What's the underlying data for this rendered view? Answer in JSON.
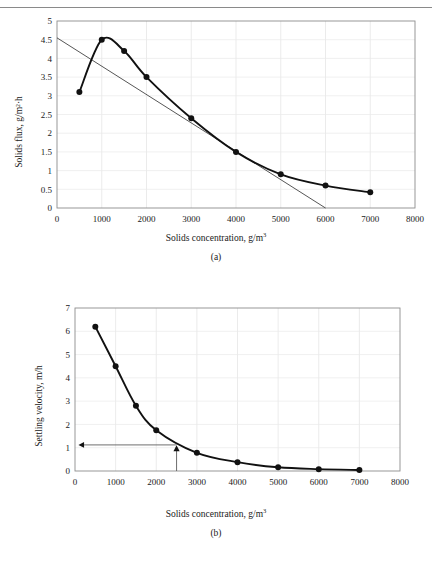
{
  "page": {
    "header_text": "",
    "background_color": "#ffffff"
  },
  "figure_a": {
    "caption": "(a)",
    "xlabel_main": "Solids concentration, g/m",
    "xlabel_sup": "3",
    "ylabel": "Solids flux, g/m²·h"
  },
  "figure_b": {
    "caption": "(b)",
    "xlabel_main": "Solids concentration, g/m",
    "xlabel_sup": "3",
    "ylabel": "Settling velocity, m/h"
  },
  "chart_data": [
    {
      "id": "a",
      "type": "line",
      "title": "",
      "xlabel": "Solids concentration, g/m3",
      "ylabel": "Solids flux, g/m2·h",
      "xlim": [
        0,
        8000
      ],
      "ylim": [
        0,
        5
      ],
      "xticks": [
        0,
        1000,
        2000,
        3000,
        4000,
        5000,
        6000,
        7000,
        8000
      ],
      "xtick_labels": [
        "0",
        "1000",
        "2000",
        "3000",
        "4000",
        "5000",
        "6000",
        "7000",
        "8000"
      ],
      "yticks": [
        0,
        0.5,
        1,
        1.5,
        2,
        2.5,
        3,
        3.5,
        4,
        4.5,
        5
      ],
      "ytick_labels": [
        "0",
        "0.5",
        "1",
        "1.5",
        "2",
        "2.5",
        "3",
        "3.5",
        "4",
        "4.5",
        "5"
      ],
      "grid": true,
      "legend": "none",
      "marker": "filled-circle",
      "series": [
        {
          "name": "Solids flux curve",
          "x": [
            500,
            1000,
            1500,
            2000,
            3000,
            4000,
            5000,
            6000,
            7000
          ],
          "values": [
            3.1,
            4.5,
            4.2,
            3.5,
            2.4,
            1.5,
            0.9,
            0.6,
            0.42
          ]
        }
      ],
      "annotations": [
        {
          "name": "tangent-line",
          "type": "line",
          "x": [
            0,
            6000
          ],
          "y": [
            4.55,
            0.0
          ]
        }
      ]
    },
    {
      "id": "b",
      "type": "line",
      "title": "",
      "xlabel": "Solids concentration, g/m3",
      "ylabel": "Settling velocity, m/h",
      "xlim": [
        0,
        8000
      ],
      "ylim": [
        0,
        7
      ],
      "xticks": [
        0,
        1000,
        2000,
        3000,
        4000,
        5000,
        6000,
        7000,
        8000
      ],
      "xtick_labels": [
        "0",
        "1000",
        "2000",
        "3000",
        "4000",
        "5000",
        "6000",
        "7000",
        "8000"
      ],
      "yticks": [
        0,
        1,
        2,
        3,
        4,
        5,
        6,
        7
      ],
      "ytick_labels": [
        "0",
        "1",
        "2",
        "3",
        "4",
        "5",
        "6",
        "7"
      ],
      "grid": true,
      "legend": "none",
      "marker": "filled-circle",
      "series": [
        {
          "name": "Settling velocity curve",
          "x": [
            500,
            1000,
            1500,
            2000,
            3000,
            4000,
            5000,
            6000,
            7000
          ],
          "values": [
            6.2,
            4.5,
            2.8,
            1.75,
            0.78,
            0.38,
            0.16,
            0.08,
            0.04
          ]
        }
      ],
      "annotations": [
        {
          "name": "design-point-vertical-arrow",
          "type": "arrow",
          "x": 2500,
          "y_from": 0,
          "y_to": 1.05,
          "marker": "filled-triangle-up"
        },
        {
          "name": "design-point-horizontal-arrow",
          "type": "arrow",
          "y": 1.12,
          "x_from": 2500,
          "x_to": 100
        }
      ]
    }
  ]
}
